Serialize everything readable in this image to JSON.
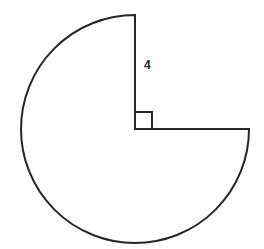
{
  "figure": {
    "background_color": "#ffffff",
    "stroke_color": "#262626",
    "stroke_width": 2,
    "label_color": "#1c1c1c"
  },
  "geometry": {
    "center": {
      "x": 135,
      "y": 129
    },
    "radius": 114,
    "removed_sector_start_angle_deg": 270,
    "removed_sector_end_angle_deg": 0,
    "removed_sector_sweep_deg": 90,
    "arc_start_point": {
      "x": 135,
      "y": 15
    },
    "arc_end_point": {
      "x": 249,
      "y": 129
    },
    "vertical_radius": {
      "from": {
        "x": 135,
        "y": 15
      },
      "to": {
        "x": 135,
        "y": 129
      }
    },
    "horizontal_radius": {
      "from": {
        "x": 135,
        "y": 129
      },
      "to": {
        "x": 249,
        "y": 129
      }
    },
    "right_angle_marker": {
      "x": 135,
      "y": 112,
      "size": 17
    }
  },
  "labels": {
    "radius_label": {
      "text": "4",
      "x": 144,
      "y": 66
    }
  },
  "paths": {
    "arc_and_radii": "M 135 15 A 114 114 0 1 0 249 129 L 135 129 Z",
    "right_angle_marker": "M 135 112 L 152 112 L 152 129"
  }
}
